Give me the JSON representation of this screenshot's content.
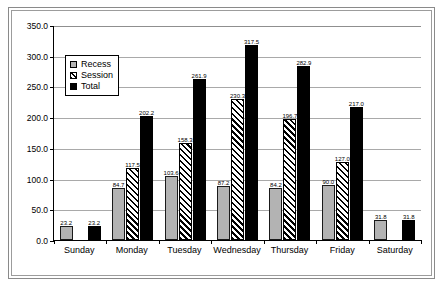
{
  "chart_data": {
    "type": "bar",
    "title": "",
    "xlabel": "",
    "ylabel": "",
    "ylim": [
      0,
      350
    ],
    "ytick_step": 50,
    "grid": true,
    "legend_position": "inside-upper-left",
    "categories": [
      "Sunday",
      "Monday",
      "Tuesday",
      "Wednesday",
      "Thursday",
      "Friday",
      "Saturday"
    ],
    "series": [
      {
        "name": "Recess",
        "style": "solid-gray",
        "values": [
          23.2,
          84.7,
          103.6,
          87.2,
          84.2,
          90.0,
          31.8
        ],
        "labels": [
          "23.2",
          "84.7",
          "103.6",
          "87.2",
          "84.2",
          "90.0",
          "31.8"
        ]
      },
      {
        "name": "Session",
        "style": "hatched",
        "values": [
          null,
          117.5,
          158.3,
          230.3,
          196.7,
          127.0,
          null
        ],
        "labels": [
          "",
          "117.5",
          "158.3",
          "230.3",
          "196.7",
          "127.0",
          ""
        ]
      },
      {
        "name": "Total",
        "style": "solid-black",
        "values": [
          23.2,
          202.2,
          261.9,
          317.5,
          282.9,
          217.0,
          31.8
        ],
        "labels": [
          "23.2",
          "202.2",
          "261.9",
          "317.5",
          "282.9",
          "217.0",
          "31.8"
        ]
      }
    ],
    "ytick_labels": [
      "350.0",
      "300.0",
      "250.0",
      "200.0",
      "150.0",
      "100.0",
      "50.0",
      "0.0"
    ],
    "ytick_values": [
      350,
      300,
      250,
      200,
      150,
      100,
      50,
      0
    ]
  },
  "legend": {
    "items": [
      {
        "label": "Recess"
      },
      {
        "label": "Session"
      },
      {
        "label": "Total"
      }
    ]
  },
  "caption": {
    "text": ""
  }
}
